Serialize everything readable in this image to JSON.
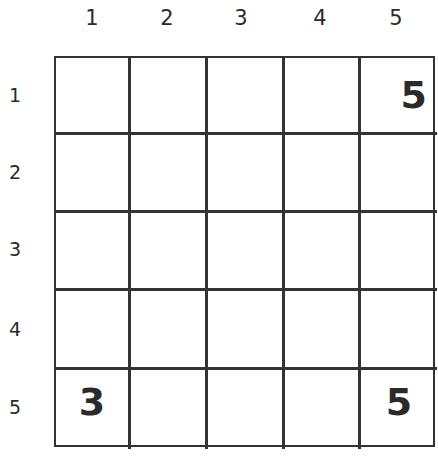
{
  "puzzle": {
    "column_labels": [
      "1",
      "2",
      "3",
      "4",
      "5"
    ],
    "row_labels": [
      "1",
      "2",
      "3",
      "4",
      "5"
    ],
    "cells": [
      [
        "",
        "",
        "",
        "",
        "5"
      ],
      [
        "",
        "",
        "",
        "",
        ""
      ],
      [
        "",
        "",
        "",
        "",
        ""
      ],
      [
        "",
        "",
        "",
        "",
        ""
      ],
      [
        "3",
        "",
        "",
        "",
        "5"
      ]
    ]
  }
}
